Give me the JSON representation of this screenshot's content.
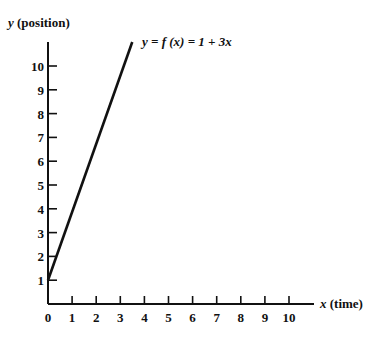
{
  "chart_data": {
    "type": "line",
    "title": "",
    "xlabel": "x (time)",
    "ylabel": "y (position)",
    "xlabel_var": "x",
    "xlabel_unit": "(time)",
    "ylabel_var": "y",
    "ylabel_unit": "(position)",
    "equation_label": "y = f (x) = 1 + 3x",
    "x_ticks": [
      "0",
      "1",
      "2",
      "3",
      "4",
      "5",
      "6",
      "7",
      "8",
      "9",
      "10"
    ],
    "y_ticks": [
      "1",
      "2",
      "3",
      "4",
      "5",
      "6",
      "7",
      "8",
      "9",
      "10"
    ],
    "xlim": [
      0,
      11
    ],
    "ylim": [
      0,
      11
    ],
    "grid": false,
    "series": [
      {
        "name": "y = 1 + 3x",
        "x": [
          0,
          1,
          2,
          3.33
        ],
        "y": [
          1,
          4,
          7,
          11
        ]
      }
    ],
    "colors": {
      "axis": "#111111",
      "line": "#111111"
    }
  }
}
